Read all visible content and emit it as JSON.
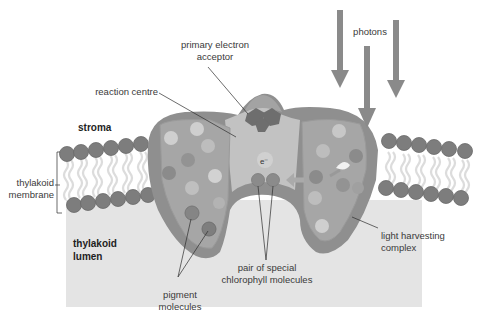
{
  "diagram": {
    "regions": {
      "stroma": "stroma",
      "lumen_line1": "thylakoid",
      "lumen_line2": "lumen"
    },
    "labels": {
      "primary_acceptor_line1": "primary electron",
      "primary_acceptor_line2": "acceptor",
      "reaction_centre": "reaction centre",
      "photons": "photons",
      "membrane_line1": "thylakoid",
      "membrane_line2": "membrane",
      "light_harvesting_line1": "light harvesting",
      "light_harvesting_line2": "complex",
      "special_pair_line1": "pair of special",
      "special_pair_line2": "chlorophyll molecules",
      "pigment_line1": "pigment",
      "pigment_line2": "molecules",
      "electron": "e⁻"
    },
    "colors": {
      "lumen_fill": "#e4e4e4",
      "phospholipid_head": "#7d7d7d",
      "lipid_tail": "#dcdcdc",
      "complex_outer": "#8f8f8f",
      "complex_inner": "#a6a6a6",
      "reaction_centre_fill": "#c2c2c2",
      "acceptor_fill": "#6e6e6e",
      "photon_arrow": "#8a8a8a",
      "label_text": "#3a3a3a"
    }
  }
}
